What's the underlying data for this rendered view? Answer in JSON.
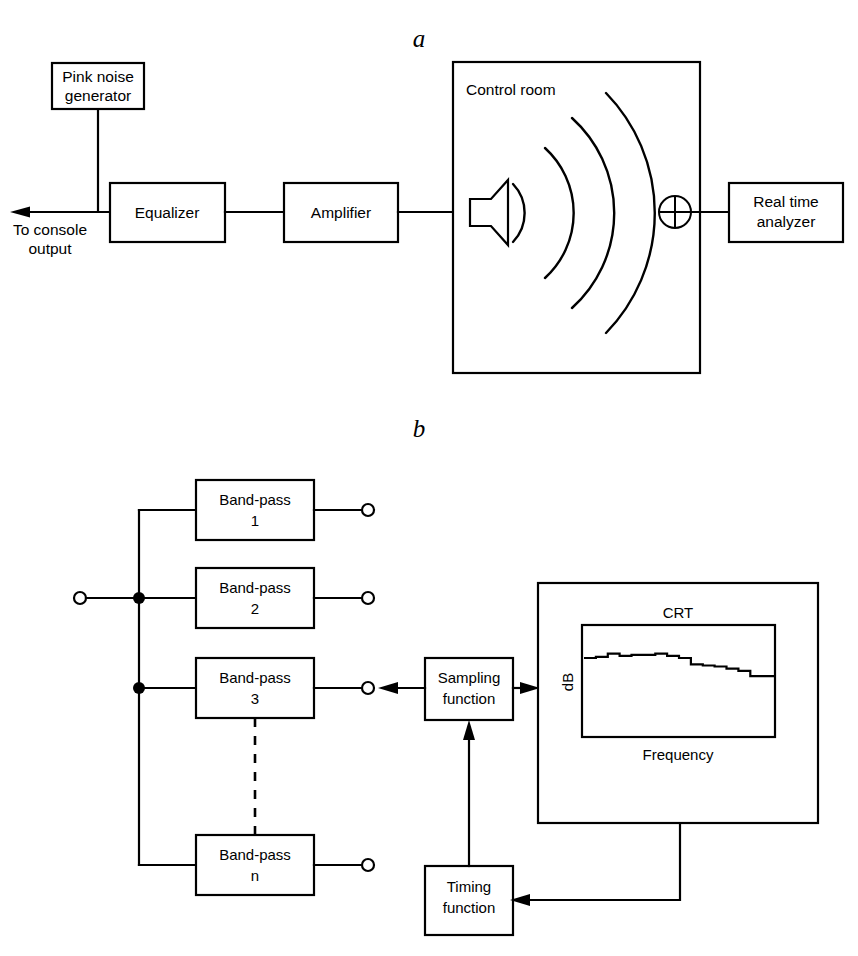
{
  "figure": {
    "panels": [
      {
        "id": "a",
        "label": "a"
      },
      {
        "id": "b",
        "label": "b"
      }
    ]
  },
  "panel_a": {
    "label": "a",
    "blocks": {
      "pink_noise": "Pink noise\ngenerator",
      "pink_noise_line1": "Pink noise",
      "pink_noise_line2": "generator",
      "equalizer": "Equalizer",
      "amplifier": "Amplifier",
      "real_time_line1": "Real time",
      "real_time_line2": "analyzer"
    },
    "room_label": "Control room",
    "output_line1": "To console",
    "output_line2": "output",
    "icons": {
      "speaker": "loudspeaker-icon",
      "microphone": "microphone-icon",
      "arrow": "arrow-left-icon",
      "waves": "sound-wave-arcs"
    }
  },
  "panel_b": {
    "label": "b",
    "filters": [
      {
        "name_line1": "Band-pass",
        "name_line2": "1"
      },
      {
        "name_line1": "Band-pass",
        "name_line2": "2"
      },
      {
        "name_line1": "Band-pass",
        "name_line2": "3"
      },
      {
        "name_line1": "Band-pass",
        "name_line2": "n"
      }
    ],
    "sampling_line1": "Sampling",
    "sampling_line2": "function",
    "timing_line1": "Timing",
    "timing_line2": "function",
    "crt_label": "CRT",
    "crt_ylabel": "dB",
    "crt_xlabel": "Frequency"
  },
  "chart_data": {
    "type": "bar",
    "title": "CRT",
    "xlabel": "Frequency",
    "ylabel": "dB",
    "grid": false,
    "legend": null,
    "categories": [
      "1",
      "2",
      "3",
      "4",
      "5",
      "6",
      "7",
      "8",
      "9",
      "10",
      "11",
      "12",
      "13",
      "14",
      "15",
      "16"
    ],
    "values": [
      72,
      73,
      76,
      74,
      75,
      75,
      76,
      74,
      72,
      66,
      65,
      64,
      62,
      60,
      55,
      55
    ],
    "ylim": [
      0,
      100
    ],
    "note": "Stepped spectrum trace shown on the CRT: roughly flat at high level across the low bands, then rolling off toward the high-frequency end."
  },
  "colors": {
    "line": "#000000",
    "fill": "#ffffff",
    "background": "#ffffff"
  }
}
